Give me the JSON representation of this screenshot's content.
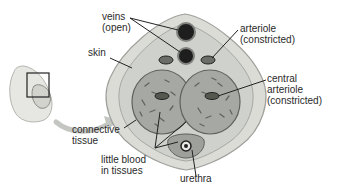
{
  "diagram": {
    "labels": {
      "veins": [
        "veins",
        "(open)"
      ],
      "skin": [
        "skin"
      ],
      "arteriole": [
        "arteriole",
        "(constricted)"
      ],
      "central_arteriole": [
        "central",
        "arteriole",
        "(constricted)"
      ],
      "connective_tissue": [
        "connective",
        "tissue"
      ],
      "little_blood": [
        "little blood",
        "in tissues"
      ],
      "urethra": [
        "urethra"
      ]
    },
    "colors": {
      "skin_outer": "#d9d9d4",
      "connective": "#c9cbc6",
      "erectile": "#a9aca6",
      "vessel_dark": "#1e1e1e",
      "text": "#2a2a2a",
      "arrow": "#b9bbb6"
    }
  }
}
